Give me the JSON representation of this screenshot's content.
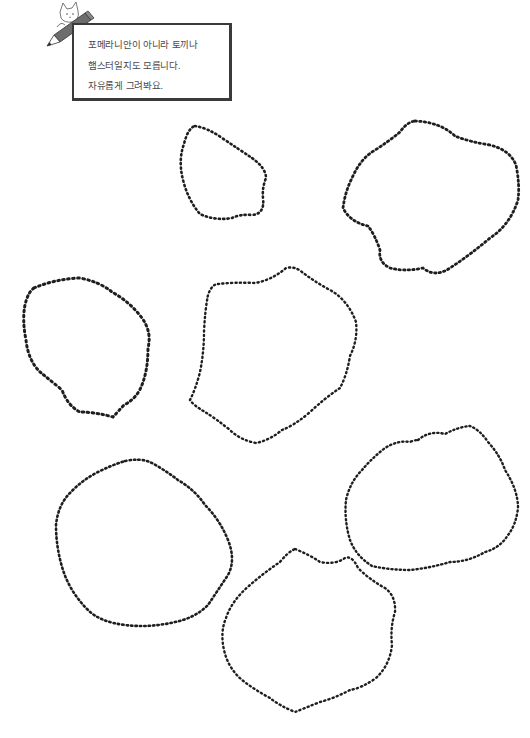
{
  "instruction_note": {
    "lines": [
      "포메라니안이 아니라 토끼나",
      "햄스터일지도 모릅니다.",
      "자유롭게 그려봐요."
    ],
    "icon": "cat-with-pencil-icon"
  },
  "outlines": {
    "count": 7,
    "style": "dotted",
    "color": "#1e1e1e",
    "items": [
      {
        "id": "outline-1",
        "position": "top-center"
      },
      {
        "id": "outline-2",
        "position": "top-right"
      },
      {
        "id": "outline-3",
        "position": "middle-left"
      },
      {
        "id": "outline-4",
        "position": "center"
      },
      {
        "id": "outline-5",
        "position": "middle-right"
      },
      {
        "id": "outline-6",
        "position": "bottom-left"
      },
      {
        "id": "outline-7",
        "position": "bottom-center"
      }
    ]
  }
}
